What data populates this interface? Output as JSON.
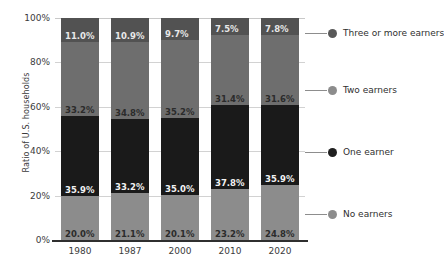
{
  "chart_data": {
    "type": "bar",
    "subtype": "stacked-100-percent",
    "title": "",
    "xlabel": "",
    "ylabel": "Ratio of U.S. households",
    "ylim": [
      0,
      100
    ],
    "y_ticks": [
      "0%",
      "20%",
      "40%",
      "60%",
      "80%",
      "100%"
    ],
    "y_tick_values": [
      0,
      20,
      40,
      60,
      80,
      100
    ],
    "grid": true,
    "legend_position": "right",
    "categories": [
      "1980",
      "1987",
      "2000",
      "2010",
      "2020"
    ],
    "series": [
      {
        "name": "No earners",
        "color": "#8c8c8c",
        "values": [
          20.0,
          21.1,
          20.1,
          23.2,
          24.8
        ],
        "labels": [
          "20.0%",
          "21.1%",
          "20.1%",
          "23.2%",
          "24.8%"
        ]
      },
      {
        "name": "One earner",
        "color": "#1a1a1a",
        "values": [
          35.9,
          33.2,
          35.0,
          37.8,
          35.9
        ],
        "labels": [
          "35.9%",
          "33.2%",
          "35.0%",
          "37.8%",
          "35.9%"
        ]
      },
      {
        "name": "Two earners",
        "color": "#6e6e6e",
        "values": [
          33.2,
          34.8,
          35.2,
          31.4,
          31.6
        ],
        "labels": [
          "33.2%",
          "34.8%",
          "35.2%",
          "31.4%",
          "31.6%"
        ]
      },
      {
        "name": "Three or more earners",
        "color": "#525252",
        "values": [
          11.0,
          10.9,
          9.7,
          7.5,
          7.8
        ],
        "labels": [
          "11.0%",
          "10.9%",
          "9.7%",
          "7.5%",
          "7.8%"
        ]
      }
    ]
  },
  "legend": [
    {
      "label": "Three or more earners",
      "color": "#595959"
    },
    {
      "label": "Two earners",
      "color": "#8c8c8c"
    },
    {
      "label": "One earner",
      "color": "#1f1f1f"
    },
    {
      "label": "No earners",
      "color": "#8c8c8c"
    }
  ]
}
